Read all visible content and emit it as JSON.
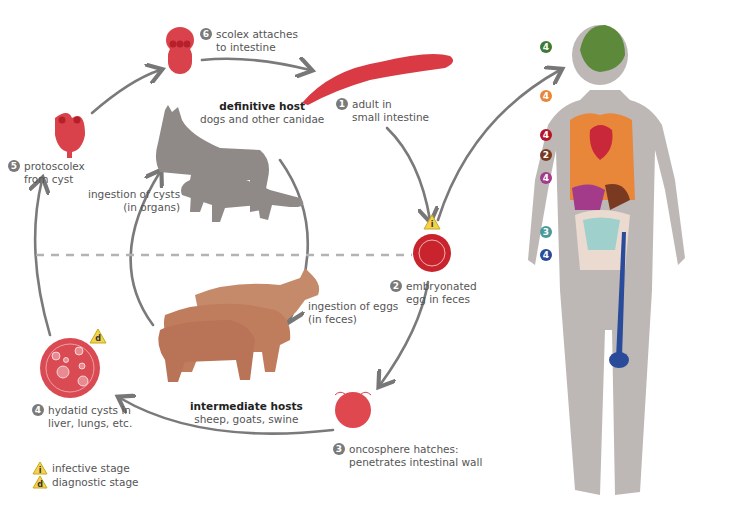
{
  "stages": [
    {
      "num": "1",
      "text": [
        "adult in",
        "small intestine"
      ]
    },
    {
      "num": "2",
      "text": [
        "embryonated",
        "egg in feces"
      ]
    },
    {
      "num": "3",
      "text": [
        "oncosphere hatches:",
        "penetrates intestinal wall"
      ]
    },
    {
      "num": "4",
      "text": [
        "hydatid cysts in",
        "liver, lungs, etc."
      ]
    },
    {
      "num": "5",
      "text": [
        "protoscolex",
        "from cyst"
      ]
    },
    {
      "num": "6",
      "text": [
        "scolex attaches",
        "to intestine"
      ]
    }
  ],
  "definitive_host": {
    "title": "definitive host",
    "subtitle": "dogs and other canidae"
  },
  "intermediate_hosts": {
    "title": "intermediate hosts",
    "subtitle": "sheep, goats, swine"
  },
  "transitions": {
    "ingestion_cysts": [
      "ingestion of cysts",
      "(in organs)"
    ],
    "ingestion_eggs": [
      "ingestion of eggs",
      "(in feces)"
    ]
  },
  "legend": [
    {
      "symbol": "i",
      "label": "infective stage"
    },
    {
      "symbol": "d",
      "label": "diagnostic stage"
    }
  ],
  "body_badges": [
    {
      "num": "4",
      "color": "#3e7a32",
      "organ": "brain"
    },
    {
      "num": "4",
      "color": "#e8873a",
      "organ": "lungs"
    },
    {
      "num": "4",
      "color": "#b3152b",
      "organ": "heart"
    },
    {
      "num": "2",
      "color": "#7a3a22",
      "organ": "stomach/spleen"
    },
    {
      "num": "4",
      "color": "#a33a8a",
      "organ": "liver"
    },
    {
      "num": "3",
      "color": "#4a9a9a",
      "organ": "intestines"
    },
    {
      "num": "4",
      "color": "#2a4a9a",
      "organ": "bone"
    }
  ],
  "colors": {
    "parasite_red": "#d9363e",
    "arrow_gray": "#777777",
    "dog_gray": "#8f8a88",
    "livestock": "#c58a6a",
    "warn_yellow": "#f3d34a",
    "body_gray": "#bdb8b6"
  }
}
